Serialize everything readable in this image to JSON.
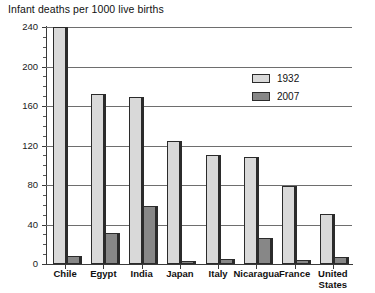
{
  "chart_data": {
    "type": "bar",
    "title": "Infant deaths per 1000 live births",
    "xlabel": "",
    "ylabel": "",
    "ylim": [
      0,
      240
    ],
    "yticks": [
      0,
      40,
      80,
      120,
      160,
      200,
      240
    ],
    "ytick_labels": [
      "0",
      "40",
      "80",
      "120",
      "160",
      "200",
      "240"
    ],
    "grid": true,
    "minor_ticks": true,
    "legend_position": "upper right",
    "categories": [
      "Chile",
      "Egypt",
      "India",
      "Japan",
      "Italy",
      "Nicaragua",
      "France",
      "United States"
    ],
    "category_labels_multiline": [
      [
        "Chile"
      ],
      [
        "Egypt"
      ],
      [
        "India"
      ],
      [
        "Japan"
      ],
      [
        "Italy"
      ],
      [
        "Nicaragua"
      ],
      [
        "France"
      ],
      [
        "United",
        "States"
      ]
    ],
    "series": [
      {
        "name": "1932",
        "color": "#d9d9d9",
        "values": [
          240,
          172,
          169,
          125,
          110,
          108,
          79,
          51
        ]
      },
      {
        "name": "2007",
        "color": "#878787",
        "values": [
          8,
          31,
          59,
          3,
          5,
          26,
          4,
          7
        ]
      }
    ]
  },
  "legend": {
    "items": [
      {
        "label": "1932",
        "swatch": "light-gray"
      },
      {
        "label": "2007",
        "swatch": "dark-gray"
      }
    ]
  },
  "colors": {
    "series_1932": "#d9d9d9",
    "series_2007": "#878787",
    "axis": "#3a3a3a",
    "grid": "#6e6e6e",
    "background": "#ffffff",
    "text": "#111111"
  }
}
